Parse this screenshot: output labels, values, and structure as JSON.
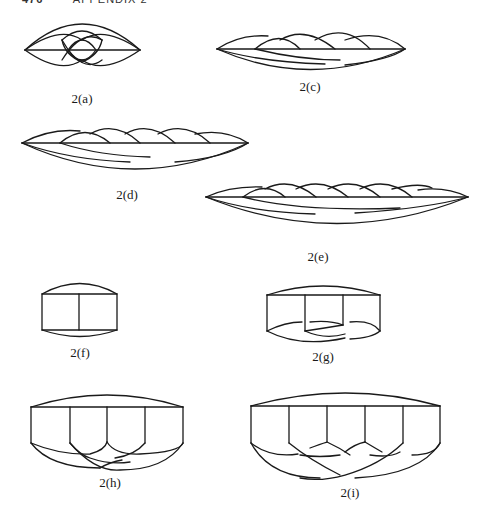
{
  "header": {
    "page_number": "476",
    "running_title": "APPENDIX 2"
  },
  "figures": [
    {
      "id": "a",
      "caption": "2(a)"
    },
    {
      "id": "c",
      "caption": "2(c)"
    },
    {
      "id": "d",
      "caption": "2(d)"
    },
    {
      "id": "e",
      "caption": "2(e)"
    },
    {
      "id": "f",
      "caption": "2(f)"
    },
    {
      "id": "g",
      "caption": "2(g)"
    },
    {
      "id": "h",
      "caption": "2(h)"
    },
    {
      "id": "i",
      "caption": "2(i)"
    }
  ]
}
